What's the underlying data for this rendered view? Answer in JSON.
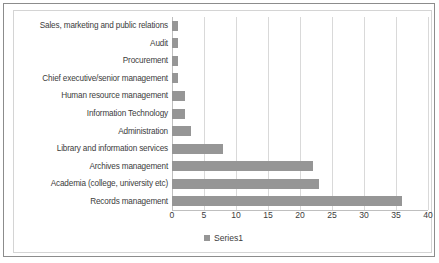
{
  "chart_data": {
    "type": "bar",
    "orientation": "horizontal",
    "title": "",
    "xlabel": "",
    "ylabel": "",
    "xlim": [
      0,
      40
    ],
    "xticks": [
      0,
      5,
      10,
      15,
      20,
      25,
      30,
      35,
      40
    ],
    "grid": true,
    "legend_position": "bottom",
    "series": [
      {
        "name": "Series1",
        "values": [
          1,
          1,
          1,
          1,
          2,
          2,
          3,
          8,
          22,
          23,
          36
        ]
      }
    ],
    "categories": [
      "Sales, marketing and public relations",
      "Audit",
      "Procurement",
      "Chief executive/senior management",
      "Human resource management",
      "Information Technology",
      "Administration",
      "Library and information services",
      "Archives management",
      "Academia (college, university etc)",
      "Records management"
    ]
  },
  "legend": {
    "entries": [
      {
        "label": "Series1",
        "color": "#969696",
        "marker": "legend-swatch-icon"
      }
    ]
  },
  "colors": {
    "bar": "#969696",
    "gridline": "#d9d9d9",
    "axis": "#bfbfbf",
    "text": "#3c3c3c",
    "chart_border": "#d4d4d4",
    "page_border": "#8c8c8c",
    "background": "#ffffff"
  }
}
